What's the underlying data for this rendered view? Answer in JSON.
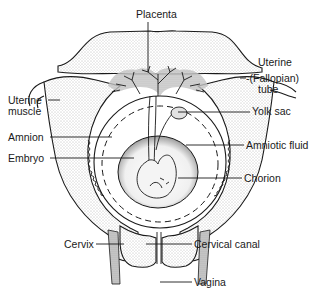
{
  "figure": {
    "labels": {
      "placenta": "Placenta",
      "uterine_tube_line1": "Uterine",
      "uterine_tube_line2": "-(Fallopian)",
      "uterine_tube_line3": "tube",
      "uterine_muscle_line1": "Uterine",
      "uterine_muscle_line2": "muscle",
      "yolk_sac": "Yolk sac",
      "amnion": "Amnion",
      "amniotic_fluid": "Amniotic fluid",
      "embryo": "Embryo",
      "chorion": "Chorion",
      "cervix": "Cervix",
      "cervical_canal": "Cervical canal",
      "vagina": "Vagina"
    }
  }
}
